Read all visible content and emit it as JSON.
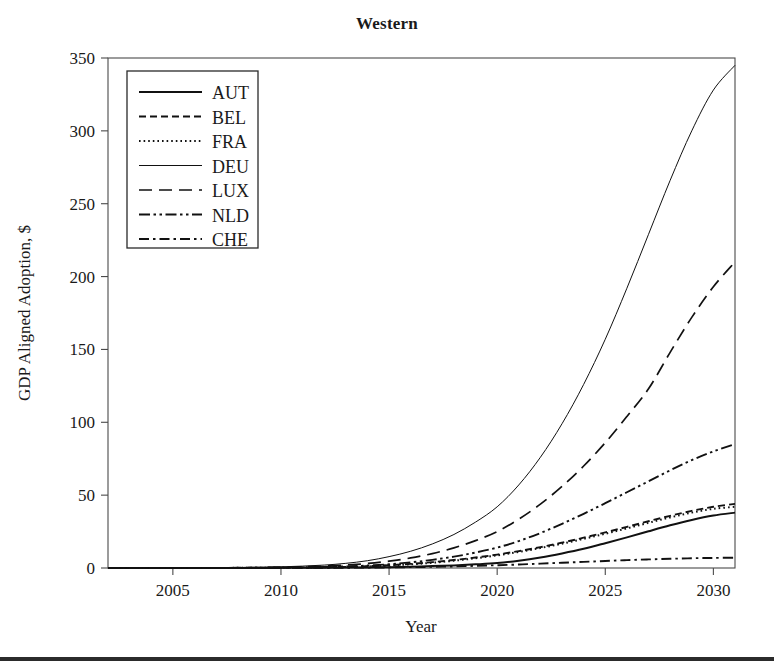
{
  "figure": {
    "title": "Western",
    "background_color": "#ffffff",
    "ink_color": "#111111",
    "bottom_bar_color": "#2b2b2b"
  },
  "axes": {
    "x_label": "Year",
    "y_label": "GDP Aligned Adoption, $",
    "x_ticks": [
      "2005",
      "2010",
      "2015",
      "2020",
      "2025",
      "2030"
    ],
    "y_ticks": [
      "0",
      "50",
      "100",
      "150",
      "200",
      "250",
      "300",
      "350"
    ]
  },
  "legend": {
    "position": "upper-left",
    "entries": [
      {
        "label": "AUT",
        "style": "solid"
      },
      {
        "label": "BEL",
        "style": "dashed-short"
      },
      {
        "label": "FRA",
        "style": "dotted"
      },
      {
        "label": "DEU",
        "style": "solid-thin"
      },
      {
        "label": "LUX",
        "style": "dashed-long"
      },
      {
        "label": "NLD",
        "style": "dash-dot-dot"
      },
      {
        "label": "CHE",
        "style": "dash-dot"
      }
    ]
  },
  "chart_data": {
    "type": "line",
    "title": "Western",
    "xlabel": "Year",
    "ylabel": "GDP Aligned Adoption, $",
    "xlim": [
      2002,
      2031
    ],
    "ylim": [
      0,
      350
    ],
    "grid": false,
    "legend_position": "upper left",
    "x": [
      2002,
      2003,
      2004,
      2005,
      2006,
      2007,
      2008,
      2009,
      2010,
      2011,
      2012,
      2013,
      2014,
      2015,
      2016,
      2017,
      2018,
      2019,
      2020,
      2021,
      2022,
      2023,
      2024,
      2025,
      2026,
      2027,
      2028,
      2029,
      2030,
      2031
    ],
    "series": [
      {
        "name": "AUT",
        "style": "solid",
        "values": [
          0,
          0,
          0,
          0,
          0,
          0,
          0,
          0,
          0.1,
          0.1,
          0.2,
          0.3,
          0.4,
          0.6,
          0.9,
          1.3,
          1.8,
          2.5,
          3.4,
          5.0,
          7.2,
          10.0,
          13.2,
          17.0,
          21.0,
          25.2,
          29.3,
          33.0,
          36.0,
          38.0
        ]
      },
      {
        "name": "BEL",
        "style": "dashed-short",
        "values": [
          0,
          0,
          0,
          0,
          0,
          0,
          0.1,
          0.1,
          0.2,
          0.3,
          0.5,
          0.8,
          1.2,
          1.9,
          2.8,
          4.0,
          5.5,
          7.2,
          9.2,
          11.6,
          14.3,
          17.4,
          20.8,
          24.4,
          28.2,
          32.1,
          35.8,
          39.2,
          42.0,
          44.0
        ]
      },
      {
        "name": "FRA",
        "style": "dotted",
        "values": [
          0,
          0,
          0,
          0,
          0,
          0,
          0.1,
          0.1,
          0.2,
          0.3,
          0.5,
          0.7,
          1.1,
          1.7,
          2.5,
          3.6,
          5.0,
          6.7,
          8.7,
          11.0,
          13.7,
          16.7,
          20.0,
          23.5,
          27.2,
          31.0,
          34.7,
          38.0,
          40.6,
          42.0
        ]
      },
      {
        "name": "DEU",
        "style": "solid-thin",
        "values": [
          0,
          0,
          0,
          0.1,
          0.1,
          0.2,
          0.3,
          0.5,
          0.8,
          1.3,
          2.0,
          3.2,
          5.0,
          7.8,
          11.5,
          16.5,
          23.0,
          31.5,
          42.0,
          57.0,
          76.0,
          99.0,
          126.0,
          157.0,
          192.0,
          229.0,
          266.0,
          300.0,
          328.0,
          345.0
        ]
      },
      {
        "name": "LUX",
        "style": "dashed-long",
        "values": [
          0,
          0,
          0,
          0,
          0.1,
          0.1,
          0.2,
          0.3,
          0.5,
          0.8,
          1.3,
          2.0,
          3.1,
          4.7,
          6.9,
          9.9,
          13.8,
          18.8,
          25.0,
          33.5,
          43.8,
          56.0,
          70.0,
          86.0,
          104.0,
          123.0,
          148.0,
          172.0,
          193.0,
          210.0
        ]
      },
      {
        "name": "NLD",
        "style": "dash-dot-dot",
        "values": [
          0,
          0,
          0,
          0,
          0,
          0.1,
          0.1,
          0.2,
          0.3,
          0.4,
          0.7,
          1.1,
          1.7,
          2.6,
          3.9,
          5.6,
          7.8,
          10.6,
          14.0,
          18.5,
          24.0,
          30.3,
          37.2,
          44.5,
          52.0,
          59.5,
          67.0,
          74.0,
          80.0,
          85.0
        ]
      },
      {
        "name": "CHE",
        "style": "dash-dot",
        "values": [
          0,
          0,
          0,
          0,
          0,
          0,
          0,
          0,
          0.1,
          0.1,
          0.1,
          0.2,
          0.3,
          0.4,
          0.6,
          0.8,
          1.1,
          1.5,
          1.9,
          2.4,
          3.0,
          3.6,
          4.2,
          4.8,
          5.4,
          5.9,
          6.3,
          6.7,
          6.9,
          7.1
        ]
      }
    ]
  }
}
